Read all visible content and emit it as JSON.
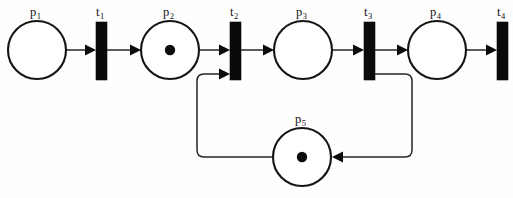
{
  "diagram": {
    "type": "petri-net",
    "width": 513,
    "height": 198,
    "background_color": "#ffffff",
    "stroke_color": "#141414",
    "fill_color": "#ffffff",
    "token_color": "#0a0a0a",
    "transition_color": "#0a0a0a"
  },
  "places": [
    {
      "id": "p1",
      "label_base": "p",
      "label_sub": "1",
      "label": "p1",
      "cx": 37,
      "cy": 50,
      "r": 29,
      "tokens": 0,
      "label_x": 30,
      "label_y": 16
    },
    {
      "id": "p2",
      "label_base": "p",
      "label_sub": "2",
      "label": "p2",
      "cx": 170,
      "cy": 50,
      "r": 29,
      "tokens": 1,
      "label_x": 163,
      "label_y": 16
    },
    {
      "id": "p3",
      "label_base": "p",
      "label_sub": "3",
      "label": "p3",
      "cx": 303,
      "cy": 50,
      "r": 29,
      "tokens": 0,
      "label_x": 296,
      "label_y": 16
    },
    {
      "id": "p4",
      "label_base": "p",
      "label_sub": "4",
      "label": "p4",
      "cx": 437,
      "cy": 50,
      "r": 29,
      "tokens": 0,
      "label_x": 430,
      "label_y": 16
    },
    {
      "id": "p5",
      "label_base": "p",
      "label_sub": "5",
      "label": "p5",
      "cx": 302,
      "cy": 157,
      "r": 29,
      "tokens": 1,
      "label_x": 295,
      "label_y": 123
    }
  ],
  "transitions": [
    {
      "id": "t1",
      "label_base": "t",
      "label_sub": "1",
      "label": "t1",
      "x": 96,
      "y": 22,
      "width": 11,
      "height": 58,
      "label_x": 96,
      "label_y": 16
    },
    {
      "id": "t2",
      "label_base": "t",
      "label_sub": "2",
      "label": "t2",
      "x": 230,
      "y": 22,
      "width": 11,
      "height": 58,
      "label_x": 230,
      "label_y": 16
    },
    {
      "id": "t3",
      "label_base": "t",
      "label_sub": "3",
      "label": "t3",
      "x": 364,
      "y": 22,
      "width": 11,
      "height": 58,
      "label_x": 364,
      "label_y": 16
    },
    {
      "id": "t4",
      "label_base": "t",
      "label_sub": "4",
      "label": "t4",
      "x": 497,
      "y": 22,
      "width": 11,
      "height": 58,
      "label_x": 497,
      "label_y": 16
    }
  ],
  "arcs": [
    {
      "id": "arc-p1-t1",
      "from": "p1",
      "to": "t1",
      "path": "M 67 50 L 91 50",
      "head": "96,50"
    },
    {
      "id": "arc-t1-p2",
      "from": "t1",
      "to": "p2",
      "path": "M 107 50 L 136 50",
      "head": "141,50"
    },
    {
      "id": "arc-p2-t2",
      "from": "p2",
      "to": "t2",
      "path": "M 200 50 L 225 50",
      "head": "230,50"
    },
    {
      "id": "arc-t2-p3",
      "from": "t2",
      "to": "p3",
      "path": "M 241 50 L 269 50",
      "head": "274,50"
    },
    {
      "id": "arc-p3-t3",
      "from": "p3",
      "to": "t3",
      "path": "M 333 50 L 359 50",
      "head": "364,50"
    },
    {
      "id": "arc-t3-p4",
      "from": "t3",
      "to": "p4",
      "path": "M 375 50 L 403 50",
      "head": "408,50"
    },
    {
      "id": "arc-p4-t4",
      "from": "p4",
      "to": "t4",
      "path": "M 467 50 L 492 50",
      "head": "497,50"
    },
    {
      "id": "arc-t3-p5",
      "from": "t3",
      "to": "p5",
      "path": "M 375 74 L 405 74 Q 412 74 412 81 L 412 150 Q 412 157 405 157 L 338 157",
      "head": "332,157"
    },
    {
      "id": "arc-p5-t2",
      "from": "p5",
      "to": "t2",
      "path": "M 272 157 L 204 157 Q 197 157 197 150 L 197 81 Q 197 74 204 74 L 225 74",
      "head": "230,74"
    }
  ],
  "arrowhead": {
    "length": 11,
    "halfwidth": 5.5
  }
}
